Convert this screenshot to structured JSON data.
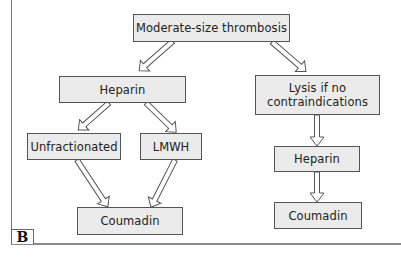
{
  "diagram": {
    "panel_label": "B",
    "nodes": {
      "root": {
        "label": "Moderate-size thrombosis"
      },
      "heparin_left": {
        "label": "Heparin"
      },
      "lysis": {
        "line1": "Lysis if no",
        "line2": "contraindications"
      },
      "unfractionated": {
        "label": "Unfractionated"
      },
      "lmwh": {
        "label": "LMWH"
      },
      "coumadin_left": {
        "label": "Coumadin"
      },
      "heparin_right": {
        "label": "Heparin"
      },
      "coumadin_right": {
        "label": "Coumadin"
      }
    },
    "edges": [
      {
        "from": "Moderate-size thrombosis",
        "to": "Heparin"
      },
      {
        "from": "Moderate-size thrombosis",
        "to": "Lysis if no contraindications"
      },
      {
        "from": "Heparin",
        "to": "Unfractionated"
      },
      {
        "from": "Heparin",
        "to": "LMWH"
      },
      {
        "from": "Unfractionated",
        "to": "Coumadin"
      },
      {
        "from": "LMWH",
        "to": "Coumadin"
      },
      {
        "from": "Lysis if no contraindications",
        "to": "Heparin"
      },
      {
        "from": "Heparin",
        "to": "Coumadin"
      }
    ],
    "colors": {
      "box_fill": "#ebebeb",
      "box_border": "#555555",
      "arrow": "#555555"
    }
  }
}
